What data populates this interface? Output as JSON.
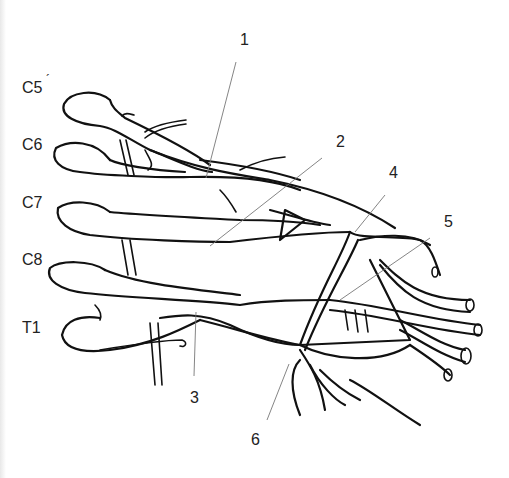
{
  "diagram": {
    "root_labels": [
      {
        "id": "c5",
        "text": "C5",
        "x": 22,
        "y": 80
      },
      {
        "id": "c6",
        "text": "C6",
        "x": 22,
        "y": 137
      },
      {
        "id": "c7",
        "text": "C7",
        "x": 22,
        "y": 195
      },
      {
        "id": "c8",
        "text": "C8",
        "x": 22,
        "y": 252
      },
      {
        "id": "t1",
        "text": "T1",
        "x": 22,
        "y": 320
      }
    ],
    "c5_mark": "´",
    "number_labels": [
      {
        "id": "n1",
        "text": "1",
        "x": 240,
        "y": 32
      },
      {
        "id": "n2",
        "text": "2",
        "x": 336,
        "y": 134
      },
      {
        "id": "n3",
        "text": "3",
        "x": 190,
        "y": 390
      },
      {
        "id": "n4",
        "text": "4",
        "x": 389,
        "y": 165
      },
      {
        "id": "n5",
        "text": "5",
        "x": 444,
        "y": 214
      },
      {
        "id": "n6",
        "text": "6",
        "x": 251,
        "y": 432
      }
    ],
    "colors": {
      "line": "#111111",
      "leader": "#777777",
      "background": "#ffffff"
    }
  }
}
